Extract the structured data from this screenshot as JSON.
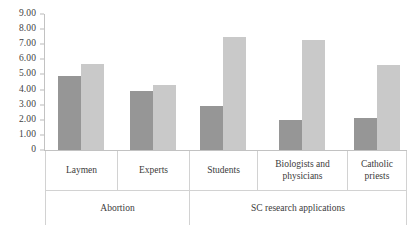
{
  "chart_data": {
    "type": "bar",
    "title": "",
    "xlabel": "",
    "ylabel": "",
    "ylim": [
      0,
      9
    ],
    "grid": false,
    "legend": "none",
    "y_ticks": [
      "0",
      "1.00",
      "2.00",
      "3.00",
      "4.00",
      "5.00",
      "6.00",
      "7.00",
      "8.00",
      "9.00"
    ],
    "y_tick_values": [
      0,
      1,
      2,
      3,
      4,
      5,
      6,
      7,
      8,
      9
    ],
    "categories": [
      "Laymen",
      "Experts",
      "Students",
      "Biologists and physicians",
      "Catholic priests"
    ],
    "groups": [
      {
        "label": "Abortion",
        "categories": [
          "Laymen",
          "Experts"
        ]
      },
      {
        "label": "SC research applications",
        "categories": [
          "Students",
          "Biologists and physicians",
          "Catholic priests"
        ]
      }
    ],
    "series": [
      {
        "name": "Series 1",
        "color": "#969696",
        "values": [
          4.9,
          3.9,
          2.9,
          2.0,
          2.1
        ]
      },
      {
        "name": "Series 2",
        "color": "#c9c9c9",
        "values": [
          5.7,
          4.3,
          7.5,
          7.3,
          5.6
        ]
      }
    ]
  },
  "colors": {
    "series_a": "#969696",
    "series_b": "#c9c9c9",
    "axis": "#c2c2c2",
    "text": "#3b3b3b",
    "table_border": "#d2d2d2"
  }
}
